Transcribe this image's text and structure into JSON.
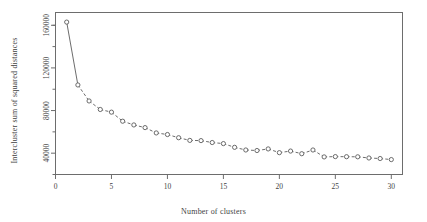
{
  "chart_data": {
    "type": "line",
    "title": "",
    "subtitle": "",
    "xlabel": "Number of clusters",
    "ylabel": "Intercluster sum of squared distances",
    "xlim": [
      0,
      31
    ],
    "ylim": [
      20000,
      172000
    ],
    "xticks": [
      0,
      5,
      10,
      15,
      20,
      25,
      30
    ],
    "xtick_labels": [
      "0",
      "5",
      "10",
      "15",
      "20",
      "25",
      "30"
    ],
    "yticks": [
      40000,
      80000,
      120000,
      160000
    ],
    "ytick_labels": [
      "40000",
      "80000",
      "120000",
      "160000"
    ],
    "grid": false,
    "legend": null,
    "marker": "open-circle",
    "linestyle": "dashed-after-first-segment",
    "x": [
      1,
      2,
      3,
      4,
      5,
      6,
      7,
      8,
      9,
      10,
      11,
      12,
      13,
      14,
      15,
      16,
      17,
      18,
      19,
      20,
      21,
      22,
      23,
      24,
      25,
      26,
      27,
      28,
      29,
      30
    ],
    "values": [
      163000,
      104000,
      89000,
      81000,
      78500,
      70000,
      66500,
      64000,
      59000,
      57500,
      54500,
      52000,
      51800,
      50000,
      49000,
      45500,
      43000,
      42500,
      44000,
      40500,
      42000,
      39500,
      43000,
      36500,
      36800,
      36700,
      36600,
      35500,
      35000,
      34000
    ],
    "series": [
      {
        "name": "Intercluster sum of squared distances",
        "color": "#5b5b5b",
        "values": [
          163000,
          104000,
          89000,
          81000,
          78500,
          70000,
          66500,
          64000,
          59000,
          57500,
          54500,
          52000,
          51800,
          50000,
          49000,
          45500,
          43000,
          42500,
          44000,
          40500,
          42000,
          39500,
          43000,
          36500,
          36800,
          36700,
          36600,
          35500,
          35000,
          34000
        ]
      }
    ]
  },
  "figure": {
    "background_color": "#ffffff",
    "axis_color": "#6d6d6d",
    "series_color": "#5b5b5b"
  }
}
